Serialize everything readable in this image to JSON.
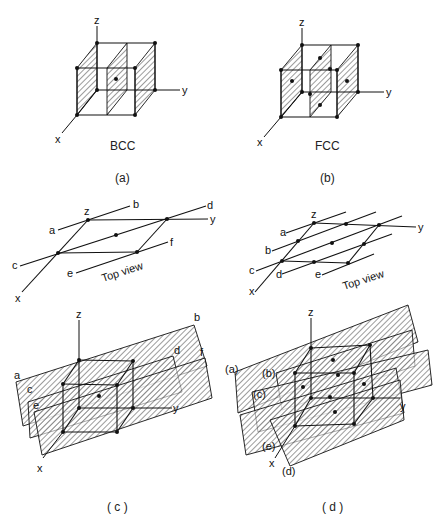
{
  "figure": {
    "panels": [
      {
        "id": "a",
        "caption": "(a)",
        "structure_label": "BCC",
        "axes": {
          "x": "x",
          "y": "y",
          "z": "z"
        },
        "description": "BCC unit cell with shaded (010)-type planes"
      },
      {
        "id": "b",
        "caption": "(b)",
        "structure_label": "FCC",
        "axes": {
          "x": "x",
          "y": "y",
          "z": "z"
        },
        "description": "FCC unit cell with shaded (010)-type planes"
      },
      {
        "id": "c",
        "caption": "( c )",
        "top_view": {
          "label": "Top view",
          "axes": {
            "x": "x",
            "y": "y",
            "z": "z"
          },
          "line_labels": [
            "a",
            "b",
            "c",
            "d",
            "e",
            "f"
          ]
        },
        "plane_labels": [
          "a",
          "b",
          "c",
          "d",
          "e",
          "f"
        ],
        "axes": {
          "x": "x",
          "y": "y",
          "z": "z"
        }
      },
      {
        "id": "d",
        "caption": "( d )",
        "top_view": {
          "label": "Top view",
          "axes": {
            "x": "x",
            "y": "y",
            "z": "z"
          },
          "line_labels": [
            "a",
            "b",
            "c",
            "d",
            "e"
          ]
        },
        "plane_labels": [
          "(a)",
          "(b)",
          "(c)",
          "(d)",
          "(e)"
        ],
        "axes": {
          "x": "x",
          "y": "y",
          "z": "z"
        }
      }
    ],
    "colors": {
      "ink": "#111111",
      "background": "#ffffff"
    }
  }
}
